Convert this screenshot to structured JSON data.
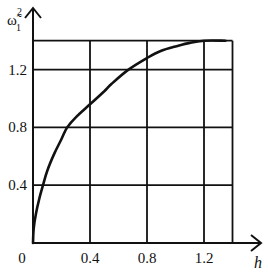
{
  "chart_data": {
    "type": "line",
    "title": "",
    "xlabel": "h",
    "ylabel": "ω̃₁²",
    "ylabel_parts": {
      "base": "ω̃",
      "sub": "1",
      "sup": "2"
    },
    "xlim": [
      0,
      1.4
    ],
    "ylim": [
      0,
      1.4
    ],
    "grid": true,
    "legend": null,
    "x_ticks": [
      0.4,
      0.8,
      1.2
    ],
    "x_tick_labels": [
      "0.4",
      "0.8",
      "1.2"
    ],
    "y_ticks": [
      0.4,
      0.8,
      1.2
    ],
    "y_tick_labels": [
      "0.4",
      "0.8",
      "1.2"
    ],
    "origin_label": "0",
    "grid_x": [
      0.4,
      0.8,
      1.2,
      1.4
    ],
    "grid_y": [
      0.4,
      0.8,
      1.2,
      1.4
    ],
    "series": [
      {
        "name": "ω̃₁²(h)",
        "x": [
          0,
          0.005,
          0.02,
          0.045,
          0.07,
          0.1,
          0.15,
          0.2,
          0.24,
          0.3,
          0.4,
          0.5,
          0.55,
          0.67,
          0.8,
          0.9,
          1.0,
          1.1,
          1.2,
          1.35
        ],
        "y": [
          0,
          0.1,
          0.2,
          0.31,
          0.4,
          0.5,
          0.62,
          0.72,
          0.8,
          0.87,
          0.96,
          1.05,
          1.1,
          1.2,
          1.28,
          1.33,
          1.36,
          1.385,
          1.4,
          1.4
        ]
      }
    ]
  },
  "plot_area": {
    "x0": 33,
    "y0": 243,
    "px_per_unit_x": 142.5,
    "px_per_unit_y": 144.5
  },
  "colors": {
    "line": "#111111",
    "grid": "#111111",
    "background": "#ffffff"
  }
}
